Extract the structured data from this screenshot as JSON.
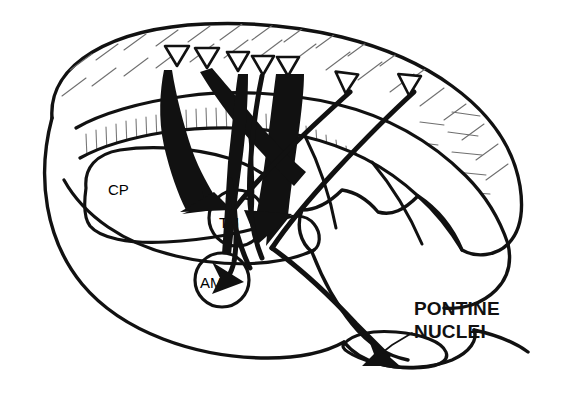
{
  "figure": {
    "domain": "Diagram",
    "kind": "neuroanatomical-schematic",
    "background_color": "#ffffff",
    "ink_color": "#111111",
    "hatch_color": "#6f6f6f",
    "width": 567,
    "height": 407
  },
  "labels": {
    "caudate_putamen": "CP",
    "thalamus": "TH",
    "amygdala": "AM",
    "pontine_nuclei_line1": "PONTINE",
    "pontine_nuclei_line2": "NUCLEI"
  },
  "structures": [
    {
      "id": "cerebral-hemisphere",
      "label": ""
    },
    {
      "id": "cortical-band-outer",
      "label": "",
      "hatching": "diagonal"
    },
    {
      "id": "cortical-band-inner",
      "label": "",
      "hatching": "vertical"
    },
    {
      "id": "caudate-putamen",
      "label": "CP"
    },
    {
      "id": "thalamus",
      "label": "TH"
    },
    {
      "id": "amygdala",
      "label": "AM"
    },
    {
      "id": "cerebellum",
      "label": ""
    },
    {
      "id": "brainstem",
      "label": ""
    },
    {
      "id": "pontine-nuclei",
      "label": "PONTINE NUCLEI"
    }
  ],
  "source_markers": {
    "shape": "downward-triangle",
    "count": 7,
    "description": "cortical layer V pyramidal cell origin markers",
    "items": [
      {
        "index": 1,
        "x": 177,
        "y": 55,
        "rotation": 0
      },
      {
        "index": 2,
        "x": 207,
        "y": 57,
        "rotation": 0
      },
      {
        "index": 3,
        "x": 238,
        "y": 61,
        "rotation": 0
      },
      {
        "index": 4,
        "x": 263,
        "y": 65,
        "rotation": 0
      },
      {
        "index": 5,
        "x": 288,
        "y": 66,
        "rotation": 0
      },
      {
        "index": 6,
        "x": 348,
        "y": 81,
        "rotation": -22
      },
      {
        "index": 7,
        "x": 411,
        "y": 83,
        "rotation": -28
      }
    ]
  },
  "projections": [
    {
      "id": "cortex-to-caudate-putamen",
      "from": "cortex",
      "to": "CP",
      "weight": "thick"
    },
    {
      "id": "cortex-to-thalamus",
      "from": "cortex",
      "to": "TH",
      "weight": "thick"
    },
    {
      "id": "cortex-to-amygdala",
      "from": "cortex",
      "to": "AM",
      "weight": "thin"
    },
    {
      "id": "cortex-to-pontine-nuclei",
      "from": "cortex",
      "to": "PONTINE NUCLEI",
      "weight": "thin"
    }
  ],
  "callout": {
    "leader_from": {
      "x": 412,
      "y": 333
    },
    "leader_to": {
      "x": 378,
      "y": 356
    }
  }
}
